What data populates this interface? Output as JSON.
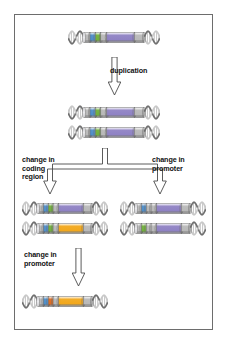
{
  "figure": {
    "background_color": "#ffffff",
    "frame_color": "#6d6d6d"
  },
  "labels": {
    "duplication": "duplication",
    "change_in_coding_region": "change in\ncoding\nregion",
    "change_in_promoter_right": "change in\npromoter",
    "change_in_promoter_bottom": "change in\npromoter"
  },
  "palette": {
    "helix_dark": "#6f6f6f",
    "helix_light": "#c8c8c8",
    "promoter_blue": "#4f8ec9",
    "promoter_green": "#72b23b",
    "promoter_orange": "#e06b1f",
    "coding_purple": "#8f82c4",
    "coding_orange": "#f2a81d",
    "spacer_gray": "#b9b9b9"
  },
  "genes": [
    {
      "id": "ancestral-gene",
      "row": "original",
      "x": 68,
      "y": 29,
      "width": 92,
      "promoter_color": "#4f8ec9",
      "promoter2_color": "#72b23b",
      "coding_color": "#8f82c4"
    },
    {
      "id": "duplicate-gene-copy-1",
      "row": "duplicated",
      "x": 68,
      "y": 104,
      "width": 92,
      "promoter_color": "#4f8ec9",
      "promoter2_color": "#72b23b",
      "coding_color": "#8f82c4"
    },
    {
      "id": "duplicate-gene-copy-2",
      "row": "duplicated",
      "x": 68,
      "y": 124,
      "width": 92,
      "promoter_color": "#4f8ec9",
      "promoter2_color": "#72b23b",
      "coding_color": "#8f82c4"
    },
    {
      "id": "coding-change-gene-unchanged",
      "row": "coding-change",
      "x": 22,
      "y": 200,
      "width": 86,
      "promoter_color": "#4f8ec9",
      "promoter2_color": "#72b23b",
      "coding_color": "#8f82c4"
    },
    {
      "id": "coding-change-gene-mutated",
      "row": "coding-change",
      "x": 22,
      "y": 220,
      "width": 86,
      "promoter_color": "#4f8ec9",
      "promoter2_color": "#72b23b",
      "coding_color": "#f2a81d"
    },
    {
      "id": "promoter-change-gene-unchanged",
      "row": "promoter-change",
      "x": 120,
      "y": 200,
      "width": 86,
      "promoter_color": "#4f8ec9",
      "promoter2_color": "#b9b9b9",
      "coding_color": "#8f82c4"
    },
    {
      "id": "promoter-change-gene-mutated",
      "row": "promoter-change",
      "x": 120,
      "y": 220,
      "width": 86,
      "promoter_color": "#72b23b",
      "promoter2_color": "#b9b9b9",
      "coding_color": "#8f82c4"
    },
    {
      "id": "final-gene-both-changes",
      "row": "final",
      "x": 22,
      "y": 293,
      "width": 86,
      "promoter_color": "#4f8ec9",
      "promoter2_color": "#e06b1f",
      "coding_color": "#f2a81d"
    }
  ],
  "arrows": [
    {
      "id": "duplication-arrow",
      "type": "down",
      "x": 108,
      "y": 57,
      "height": 38
    },
    {
      "id": "divergence-fork-arrow",
      "type": "fork",
      "x": 40,
      "y": 148,
      "width": 130,
      "height": 46
    },
    {
      "id": "promoter-change-arrow",
      "type": "down",
      "x": 72,
      "y": 248,
      "height": 38
    }
  ]
}
